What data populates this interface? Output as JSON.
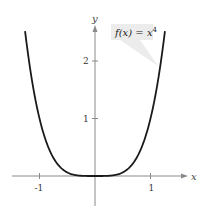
{
  "chart_data": {
    "type": "line",
    "title": "",
    "function_label": "f(x) = x^4",
    "function_label_parts": {
      "name": "f(x) = x",
      "exponent": "4"
    },
    "xlabel": "x",
    "ylabel": "y",
    "x_ticks": [
      -1,
      1
    ],
    "x_tick_labels": [
      "-1",
      "1"
    ],
    "y_ticks": [
      1,
      2
    ],
    "y_tick_labels": [
      "1",
      "2"
    ],
    "xlim": [
      -1.25,
      1.25
    ],
    "ylim": [
      0,
      2.5
    ],
    "grid": false,
    "series": [
      {
        "name": "f(x) = x^4",
        "x": [
          -1.26,
          -1.2,
          -1.1,
          -1.0,
          -0.9,
          -0.8,
          -0.7,
          -0.6,
          -0.5,
          -0.4,
          -0.3,
          -0.2,
          -0.1,
          0,
          0.1,
          0.2,
          0.3,
          0.4,
          0.5,
          0.6,
          0.7,
          0.8,
          0.9,
          1.0,
          1.1,
          1.2,
          1.26
        ],
        "y": [
          2.52,
          2.07,
          1.46,
          1.0,
          0.656,
          0.41,
          0.24,
          0.13,
          0.0625,
          0.0256,
          0.0081,
          0.0016,
          0.0001,
          0,
          0.0001,
          0.0016,
          0.0081,
          0.0256,
          0.0625,
          0.13,
          0.24,
          0.41,
          0.656,
          1.0,
          1.46,
          2.07,
          2.52
        ],
        "color": "#1a1a1a"
      }
    ]
  },
  "colors": {
    "curve": "#1a1a1a",
    "axis": "#888888",
    "callout_bg": "#ececec"
  }
}
